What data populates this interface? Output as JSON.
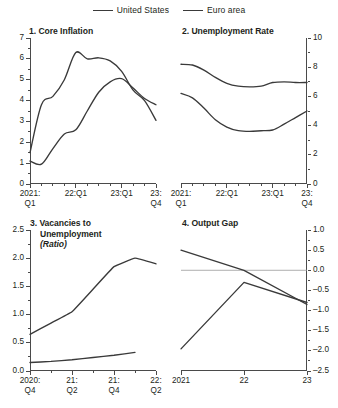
{
  "legend": {
    "entries": [
      {
        "label": "United States",
        "color": "#3a3a3a"
      },
      {
        "label": "Euro area",
        "color": "#3a3a3a"
      }
    ]
  },
  "chart_data": [
    {
      "type": "line",
      "panel": "1",
      "title": "1. Core Inflation",
      "title_lines": [
        "1. Core Inflation"
      ],
      "xlabel": "",
      "ylabel": "",
      "ylim": [
        0,
        7
      ],
      "yticks": [
        0,
        1,
        2,
        3,
        4,
        5,
        6,
        7
      ],
      "ytick_labels": [
        "0",
        "1",
        "2",
        "3",
        "4",
        "5",
        "6",
        "7"
      ],
      "axis_side": "left",
      "grid": false,
      "x": [
        "2021:Q1",
        "2021:Q2",
        "2021:Q3",
        "2021:Q4",
        "22:Q1",
        "22:Q2",
        "22:Q3",
        "22:Q4",
        "23:Q1",
        "23:Q2",
        "23:Q3",
        "23:Q4"
      ],
      "xtick_labels": [
        "2021:\nQ1",
        "22:Q1",
        "23:Q1",
        "23:\nQ4"
      ],
      "xtick_positions": [
        0,
        4,
        8,
        11
      ],
      "series": [
        {
          "name": "United States",
          "values": [
            1.5,
            3.8,
            4.2,
            5.0,
            6.3,
            6.0,
            6.05,
            5.9,
            5.4,
            4.5,
            4.0,
            3.05
          ]
        },
        {
          "name": "Euro area",
          "values": [
            1.1,
            0.95,
            1.7,
            2.4,
            2.6,
            3.5,
            4.4,
            4.9,
            5.05,
            4.6,
            4.1,
            3.8
          ]
        }
      ]
    },
    {
      "type": "line",
      "panel": "2",
      "title": "2. Unemployment Rate",
      "title_lines": [
        "2. Unemployment Rate"
      ],
      "xlabel": "",
      "ylabel": "",
      "ylim": [
        0,
        10
      ],
      "yticks": [
        0,
        2,
        4,
        6,
        8,
        10
      ],
      "ytick_labels": [
        "0",
        "2",
        "4",
        "6",
        "8",
        "10"
      ],
      "axis_side": "right",
      "grid": false,
      "x": [
        "2021:Q1",
        "2021:Q2",
        "2021:Q3",
        "2021:Q4",
        "22:Q1",
        "22:Q2",
        "22:Q3",
        "22:Q4",
        "23:Q1",
        "23:Q2",
        "23:Q3",
        "23:Q4"
      ],
      "xtick_labels": [
        "2021:\nQ1",
        "22:Q1",
        "23:Q1",
        "23:\nQ4"
      ],
      "xtick_positions": [
        0,
        4,
        8,
        11
      ],
      "series": [
        {
          "name": "United States",
          "values": [
            6.2,
            5.9,
            5.2,
            4.4,
            3.9,
            3.65,
            3.6,
            3.65,
            3.7,
            4.1,
            4.55,
            5.0
          ]
        },
        {
          "name": "Euro area",
          "values": [
            8.2,
            8.15,
            7.8,
            7.3,
            6.9,
            6.7,
            6.65,
            6.7,
            6.95,
            7.0,
            6.95,
            6.95
          ]
        }
      ]
    },
    {
      "type": "line",
      "panel": "3",
      "title": "3. Vacancies to Unemployment (Ratio)",
      "title_lines": [
        "3. Vacancies to",
        "Unemployment",
        "(Ratio)"
      ],
      "xlabel": "",
      "ylabel": "",
      "ylim": [
        0.0,
        2.5
      ],
      "yticks": [
        0.0,
        0.5,
        1.0,
        1.5,
        2.0,
        2.5
      ],
      "ytick_labels": [
        "0.0",
        "0.5",
        "1.0",
        "1.5",
        "2.0",
        "2.5"
      ],
      "axis_side": "left",
      "grid": false,
      "x": [
        "2020:Q4",
        "21:Q1",
        "21:Q2",
        "21:Q3",
        "21:Q4",
        "22:Q1",
        "22:Q2"
      ],
      "xtick_labels": [
        "2020:\nQ4",
        "21:\nQ2",
        "21:\nQ4",
        "22:\nQ2"
      ],
      "xtick_positions": [
        0,
        2,
        4,
        6
      ],
      "series": [
        {
          "name": "United States",
          "values": [
            0.65,
            0.85,
            1.05,
            1.45,
            1.85,
            2.0,
            1.9
          ]
        },
        {
          "name": "Euro area",
          "values": [
            0.15,
            0.17,
            0.2,
            0.24,
            0.28,
            0.33,
            null
          ]
        }
      ]
    },
    {
      "type": "line",
      "panel": "4",
      "title": "4. Output Gap",
      "title_lines": [
        "4. Output Gap"
      ],
      "xlabel": "",
      "ylabel": "",
      "ylim": [
        -2.5,
        1.0
      ],
      "yticks": [
        1.0,
        0.5,
        0.0,
        -0.5,
        -1.0,
        -1.5,
        -2.0,
        -2.5
      ],
      "ytick_labels": [
        "1.0",
        "0.5",
        "0.0",
        "–0.5",
        "–1.0",
        "–1.5",
        "–2.0",
        "–2.5"
      ],
      "axis_side": "right",
      "grid": false,
      "zero_line": true,
      "x": [
        "2021",
        "22",
        "23"
      ],
      "xtick_labels": [
        "2021",
        "22",
        "23"
      ],
      "xtick_positions": [
        0,
        1,
        2
      ],
      "series": [
        {
          "name": "United States",
          "values": [
            0.5,
            0.0,
            -0.85
          ]
        },
        {
          "name": "Euro area",
          "values": [
            -1.95,
            -0.3,
            -0.8
          ]
        }
      ]
    }
  ]
}
